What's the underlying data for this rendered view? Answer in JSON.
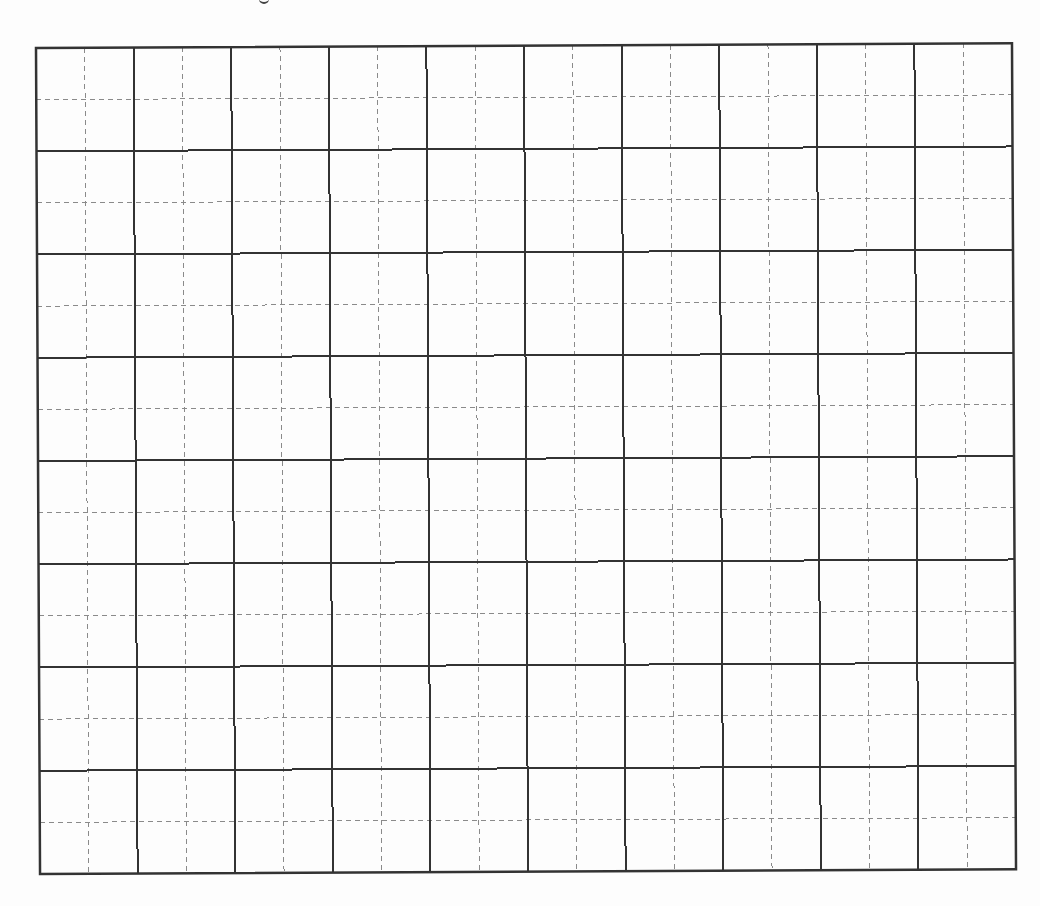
{
  "page": {
    "background": "#ffffff",
    "top_fragment_visible": true
  },
  "grid": {
    "major_columns": 10,
    "major_rows": 8,
    "subdivisions_per_cell": 2,
    "width_px": 976,
    "height_px": 826,
    "major_line_color": "#333333",
    "major_line_width": 2,
    "minor_line_color": "#8a8a8a",
    "minor_line_width": 1,
    "minor_line_style": "dashed",
    "minor_dash_pattern": [
      5,
      4
    ],
    "rotation_deg": -0.28,
    "content": "empty"
  }
}
